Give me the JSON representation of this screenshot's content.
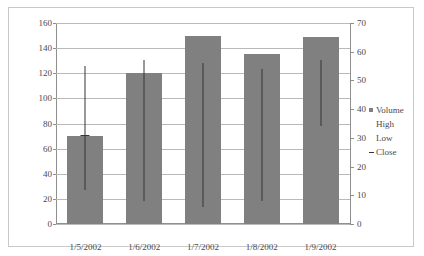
{
  "chart_data": {
    "type": "bar",
    "title": "",
    "xlabel": "",
    "ylabel": "",
    "grid": true,
    "legend_position": "right",
    "categories": [
      "1/5/2002",
      "1/6/2002",
      "1/7/2002",
      "1/8/2002",
      "1/9/2002"
    ],
    "left_axis": {
      "name": "Volume",
      "min": 0,
      "max": 160,
      "step": 20,
      "ticks": [
        "0",
        "20",
        "40",
        "60",
        "80",
        "100",
        "120",
        "140",
        "160"
      ]
    },
    "right_axis": {
      "name": "Price",
      "min": 0,
      "max": 70,
      "step": 10,
      "ticks": [
        "0",
        "10",
        "20",
        "30",
        "40",
        "50",
        "60",
        "70"
      ]
    },
    "series": [
      {
        "name": "Volume",
        "axis": "left",
        "type": "bar",
        "color": "#808080",
        "values": [
          70,
          120,
          150,
          135,
          149
        ]
      },
      {
        "name": "High",
        "axis": "right",
        "type": "high-low",
        "color": "#35353a",
        "values": [
          55,
          57,
          56,
          54,
          57
        ]
      },
      {
        "name": "Low",
        "axis": "right",
        "type": "high-low",
        "color": "#35353a",
        "values": [
          12,
          8,
          6,
          8,
          34
        ]
      },
      {
        "name": "Close",
        "axis": "right",
        "type": "marker",
        "color": "#35353a",
        "values": [
          31,
          null,
          null,
          null,
          null
        ]
      }
    ]
  },
  "legend": {
    "items": [
      {
        "label": "Volume",
        "marker": "square"
      },
      {
        "label": "High",
        "marker": "none"
      },
      {
        "label": "Low",
        "marker": "none"
      },
      {
        "label": "Close",
        "marker": "dash"
      }
    ]
  }
}
